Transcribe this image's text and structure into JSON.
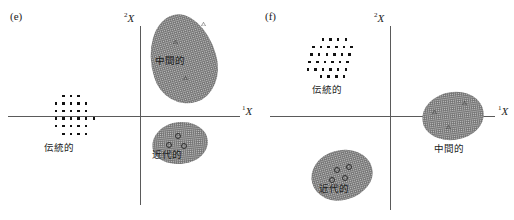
{
  "figure": {
    "axis_label_x": "X",
    "axis_label_x_sub": "1",
    "axis_label_y": "X",
    "axis_label_y_sub": "2"
  },
  "panels": [
    {
      "id": "e",
      "label": "(e)",
      "groups": [
        {
          "key": "traditional",
          "label": "伝統的",
          "marker": "filled-square-dots",
          "count": 27,
          "quadrant": "negative-x-on-axis"
        },
        {
          "key": "intermediate",
          "label": "中間的",
          "marker": "triangle",
          "count": 3,
          "quadrant": "upper-right"
        },
        {
          "key": "modern",
          "label": "近代的",
          "marker": "circle",
          "count": 3,
          "quadrant": "lower-right"
        }
      ]
    },
    {
      "id": "f",
      "label": "(f)",
      "groups": [
        {
          "key": "traditional",
          "label": "伝統的",
          "marker": "filled-square-dots",
          "count": 30,
          "quadrant": "upper-left"
        },
        {
          "key": "intermediate",
          "label": "中間的",
          "marker": "triangle",
          "count": 3,
          "quadrant": "right-on-axis"
        },
        {
          "key": "modern",
          "label": "近代的",
          "marker": "circle",
          "count": 4,
          "quadrant": "lower-left"
        }
      ]
    }
  ],
  "chart_data": {
    "type": "scatter",
    "title": "",
    "xlabel": "X1",
    "ylabel": "X2",
    "grid": false,
    "legend": "none",
    "axis_style": "crossing-axes-through-origin",
    "panels": [
      {
        "panel": "(e)",
        "clusters": [
          {
            "name": "伝統的",
            "marker": "filled-square",
            "n": 27,
            "centroid": [
              -0.62,
              0.0
            ],
            "shape": "dot-lattice-ellipse",
            "shaded": false
          },
          {
            "name": "中間的",
            "marker": "open-triangle",
            "n": 3,
            "centroid": [
              0.48,
              0.58
            ],
            "shape": "tilted-ellipse",
            "shaded": true,
            "points": [
              [
                0.66,
                0.82
              ],
              [
                0.36,
                0.6
              ],
              [
                0.47,
                0.26
              ]
            ]
          },
          {
            "name": "近代的",
            "marker": "open-circle",
            "n": 3,
            "centroid": [
              0.42,
              -0.36
            ],
            "shape": "rounded-blob",
            "shaded": true,
            "points": [
              [
                0.44,
                -0.29
              ],
              [
                0.35,
                -0.4
              ],
              [
                0.5,
                -0.4
              ]
            ]
          }
        ]
      },
      {
        "panel": "(f)",
        "clusters": [
          {
            "name": "伝統的",
            "marker": "filled-square",
            "n": 30,
            "centroid": [
              -0.45,
              0.55
            ],
            "shape": "dot-lattice-ellipse",
            "shaded": false
          },
          {
            "name": "中間的",
            "marker": "open-triangle",
            "n": 3,
            "centroid": [
              0.62,
              0.0
            ],
            "shape": "rounded-blob",
            "shaded": true,
            "points": [
              [
                0.46,
                0.06
              ],
              [
                0.76,
                0.14
              ],
              [
                0.62,
                -0.12
              ]
            ]
          },
          {
            "name": "近代的",
            "marker": "open-circle",
            "n": 4,
            "centroid": [
              -0.5,
              -0.52
            ],
            "shape": "tilted-blob",
            "shaded": true,
            "points": [
              [
                -0.54,
                -0.44
              ],
              [
                -0.43,
                -0.46
              ],
              [
                -0.58,
                -0.55
              ],
              [
                -0.46,
                -0.57
              ]
            ]
          }
        ]
      }
    ]
  }
}
